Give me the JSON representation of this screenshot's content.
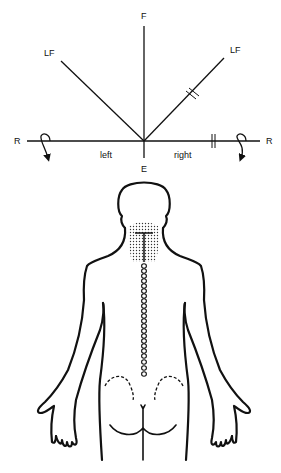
{
  "diagram": {
    "axis_labels": {
      "top": "F",
      "bottom": "E",
      "upper_left": "LF",
      "upper_right": "LF",
      "left": "R",
      "right": "R",
      "left_side": "left",
      "right_side": "right"
    },
    "markers": {
      "right_diagonal_ticks": "double-tick-mark",
      "right_horizontal_ticks": "double-tick-mark",
      "rotation_arrows": [
        "left-rotation-arrow",
        "right-rotation-arrow"
      ]
    },
    "figure": {
      "view": "posterior body outline",
      "shaded_region": "neck",
      "vertebrae_count": 22
    },
    "colors": {
      "line": "#111111",
      "background": "#ffffff"
    }
  }
}
